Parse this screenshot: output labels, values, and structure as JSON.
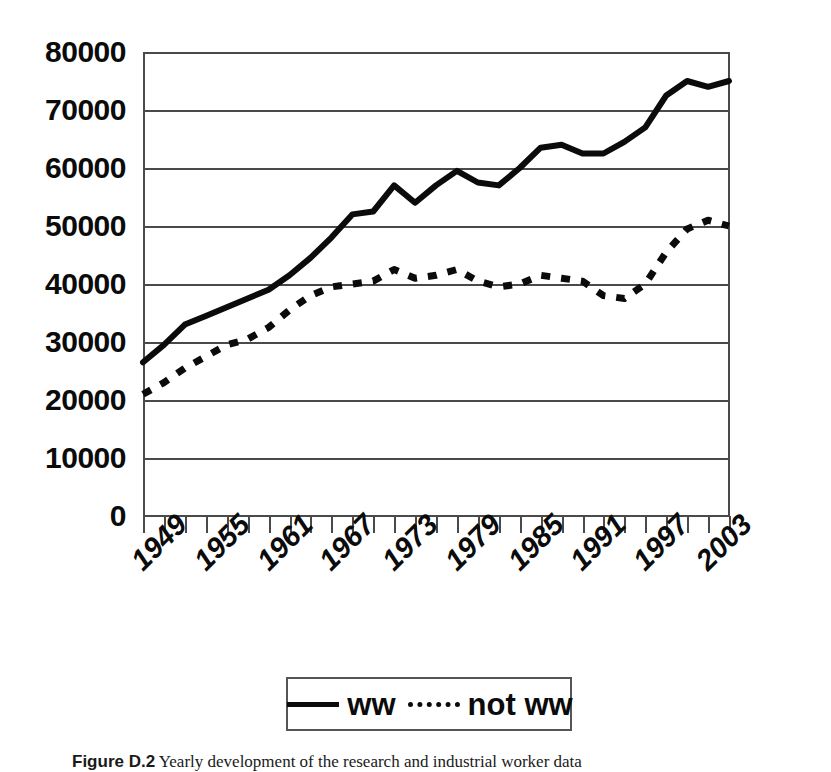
{
  "chart_data": {
    "type": "line",
    "title": "",
    "xlabel": "",
    "ylabel": "",
    "ylim": [
      0,
      80000
    ],
    "xlim": [
      1947,
      2003
    ],
    "grid": true,
    "legend_position": "bottom",
    "y_ticks": [
      "80000",
      "70000",
      "60000",
      "50000",
      "40000",
      "30000",
      "20000",
      "10000",
      "0"
    ],
    "y_tick_values": [
      80000,
      70000,
      60000,
      50000,
      40000,
      30000,
      20000,
      10000,
      0
    ],
    "x_tick_labels": [
      "1949",
      "1955",
      "1961",
      "1967",
      "1973",
      "1979",
      "1985",
      "1991",
      "1997",
      "2003"
    ],
    "x_tick_label_values": [
      1949,
      1955,
      1961,
      1967,
      1973,
      1979,
      1985,
      1991,
      1997,
      2003
    ],
    "x_minor_tick_step": 2,
    "x": [
      1947,
      1949,
      1951,
      1953,
      1955,
      1957,
      1959,
      1961,
      1963,
      1965,
      1967,
      1969,
      1971,
      1973,
      1975,
      1977,
      1979,
      1981,
      1983,
      1985,
      1987,
      1989,
      1991,
      1993,
      1995,
      1997,
      1999,
      2001,
      2003
    ],
    "series": [
      {
        "name": "ww",
        "style": "solid",
        "color": "#0b0b0b",
        "values": [
          26500,
          29500,
          33000,
          34500,
          36000,
          37500,
          39000,
          41500,
          44500,
          48000,
          52000,
          52500,
          57000,
          54000,
          57000,
          59500,
          57500,
          57000,
          60000,
          63500,
          64000,
          62500,
          62500,
          64500,
          67000,
          72500,
          75000,
          74000,
          75000
        ]
      },
      {
        "name": "not ww",
        "style": "dashed",
        "color": "#0b0b0b",
        "values": [
          21000,
          23000,
          25500,
          27500,
          29500,
          30500,
          32500,
          35500,
          38000,
          39500,
          40000,
          40500,
          42500,
          41000,
          41500,
          42500,
          40500,
          39500,
          40000,
          41500,
          41000,
          40500,
          38000,
          37500,
          40000,
          45500,
          49500,
          51000,
          50000
        ]
      }
    ]
  },
  "legend": {
    "entries": [
      {
        "label": "ww",
        "style": "solid"
      },
      {
        "label": "not ww",
        "style": "dashed"
      }
    ]
  },
  "caption": {
    "label": "Figure D.2",
    "text": " Yearly development of the research and industrial worker data"
  }
}
